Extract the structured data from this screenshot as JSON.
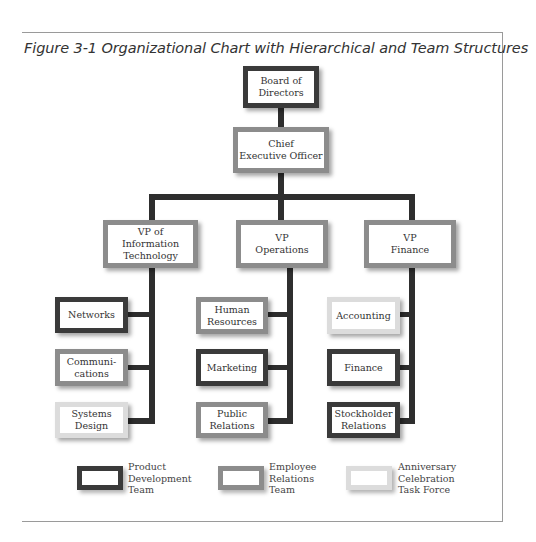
{
  "figure": {
    "title": "Figure 3-1  Organizational Chart with Hierarchical and Team Structures"
  },
  "colors": {
    "product_development": "#3a3a3a",
    "employee_relations": "#8c8c8c",
    "anniversary_celebration": "#dcdcdc",
    "connector": "#2e2e2e"
  },
  "nodes": {
    "board": {
      "label": "Board of\nDirectors",
      "team": "Product Development Team"
    },
    "ceo": {
      "label": "Chief\nExecutive Officer",
      "team": "Employee Relations Team"
    },
    "vp_it": {
      "label": "VP of\nInformation\nTechnology",
      "team": "Employee Relations Team"
    },
    "vp_ops": {
      "label": "VP\nOperations",
      "team": "Employee Relations Team"
    },
    "vp_fin": {
      "label": "VP\nFinance",
      "team": "Employee Relations Team"
    },
    "networks": {
      "label": "Networks",
      "team": "Product Development Team"
    },
    "communications": {
      "label": "Communi-\ncations",
      "team": "Employee Relations Team"
    },
    "systems_design": {
      "label": "Systems\nDesign",
      "team": "Anniversary Celebration Task Force"
    },
    "human_resources": {
      "label": "Human\nResources",
      "team": "Employee Relations Team"
    },
    "marketing": {
      "label": "Marketing",
      "team": "Product Development Team"
    },
    "public_relations": {
      "label": "Public\nRelations",
      "team": "Employee Relations Team"
    },
    "accounting": {
      "label": "Accounting",
      "team": "Anniversary Celebration Task Force"
    },
    "finance": {
      "label": "Finance",
      "team": "Product Development Team"
    },
    "stockholder_relations": {
      "label": "Stockholder\nRelations",
      "team": "Product Development Team"
    }
  },
  "legend": [
    {
      "label": "Product\nDevelopment\nTeam",
      "color": "#3a3a3a"
    },
    {
      "label": "Employee\nRelations\nTeam",
      "color": "#8c8c8c"
    },
    {
      "label": "Anniversary\nCelebration\nTask Force",
      "color": "#dcdcdc"
    }
  ]
}
